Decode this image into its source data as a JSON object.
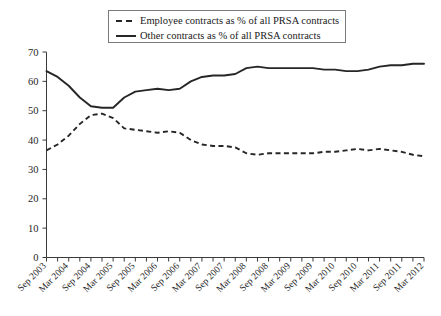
{
  "chart_data": {
    "type": "line",
    "title": "",
    "subtitle": "",
    "xlabel": "",
    "ylabel": "",
    "ylim": [
      0,
      70
    ],
    "yticks": [
      0,
      10,
      20,
      30,
      40,
      50,
      60,
      70
    ],
    "grid": false,
    "legend_position": "top-center",
    "x": [
      "Sep 2003",
      "Dec 2003",
      "Mar 2004",
      "Jun 2004",
      "Sep 2004",
      "Dec 2004",
      "Mar 2005",
      "Jun 2005",
      "Sep 2005",
      "Dec 2005",
      "Mar 2006",
      "Jun 2006",
      "Sep 2006",
      "Dec 2006",
      "Mar 2007",
      "Jun 2007",
      "Sep 2007",
      "Dec 2007",
      "Mar 2008",
      "Jun 2008",
      "Sep 2008",
      "Dec 2008",
      "Mar 2009",
      "Jun 2009",
      "Sep 2009",
      "Dec 2009",
      "Mar 2010",
      "Jun 2010",
      "Sep 2010",
      "Dec 2010",
      "Mar 2011",
      "Jun 2011",
      "Sep 2011",
      "Dec 2011",
      "Mar 2012"
    ],
    "xtick_labels": [
      "Sep 2003",
      "",
      "Mar 2004",
      "",
      "Sep 2004",
      "",
      "Mar 2005",
      "",
      "Sep 2005",
      "",
      "Mar 2006",
      "",
      "Sep 2006",
      "",
      "Mar 2007",
      "",
      "Sep 2007",
      "",
      "Mar 2008",
      "",
      "Sep 2008",
      "",
      "Mar 2009",
      "",
      "Sep 2009",
      "",
      "Mar 2010",
      "",
      "Sep 2010",
      "",
      "Mar 2011",
      "",
      "Sep 2011",
      "",
      "Mar 2012"
    ],
    "series": [
      {
        "name": "Employee contracts as % of all PRSA contracts",
        "style": "dashed",
        "color": "#262626",
        "values": [
          36.5,
          38.5,
          41.5,
          45.5,
          48.5,
          49.0,
          47.5,
          44.0,
          43.5,
          43.0,
          42.5,
          43.0,
          42.5,
          40.0,
          38.5,
          38.0,
          38.0,
          37.5,
          35.5,
          35.0,
          35.5,
          35.5,
          35.5,
          35.5,
          35.5,
          36.0,
          36.0,
          36.5,
          37.0,
          36.5,
          37.0,
          36.5,
          36.0,
          35.0,
          34.5
        ]
      },
      {
        "name": "Other contracts as % of all PRSA contracts",
        "style": "solid",
        "color": "#262626",
        "values": [
          63.5,
          61.5,
          58.5,
          54.5,
          51.5,
          51.0,
          51.0,
          54.5,
          56.5,
          57.0,
          57.5,
          57.0,
          57.5,
          60.0,
          61.5,
          62.0,
          62.0,
          62.5,
          64.5,
          65.0,
          64.5,
          64.5,
          64.5,
          64.5,
          64.5,
          64.0,
          64.0,
          63.5,
          63.5,
          64.0,
          65.0,
          65.5,
          65.5,
          66.0,
          66.0
        ]
      }
    ]
  },
  "legend": {
    "items": [
      {
        "label": "Employee contracts as % of all PRSA contracts",
        "style": "dashed"
      },
      {
        "label": "Other contracts as % of all PRSA contracts",
        "style": "solid"
      }
    ]
  }
}
